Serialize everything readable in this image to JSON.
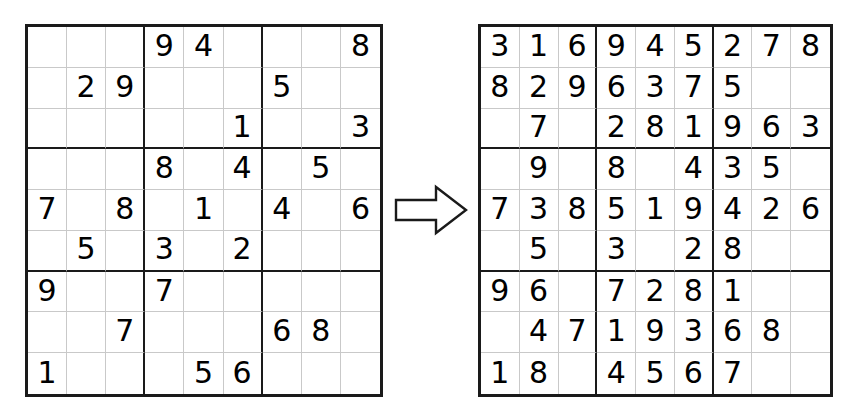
{
  "diagram": {
    "name": "sudoku-puzzle-to-solution",
    "arrow_label": "right-arrow",
    "ink_color": "#000000",
    "grid_line_color": "#c9c9c9",
    "block_line_color": "#1a1a1a",
    "background_color": "#ffffff"
  },
  "puzzle": {
    "title": "Sudoku puzzle (givens)",
    "rows": [
      [
        "",
        "",
        "",
        "9",
        "4",
        "",
        "",
        "",
        "8"
      ],
      [
        "",
        "2",
        "9",
        "",
        "",
        "",
        "5",
        "",
        ""
      ],
      [
        "",
        "",
        "",
        "",
        "",
        "1",
        "",
        "",
        "3"
      ],
      [
        "",
        "",
        "",
        "8",
        "",
        "4",
        "",
        "5",
        ""
      ],
      [
        "7",
        "",
        "8",
        "",
        "1",
        "",
        "4",
        "",
        "6"
      ],
      [
        "",
        "5",
        "",
        "3",
        "",
        "2",
        "",
        "",
        ""
      ],
      [
        "9",
        "",
        "",
        "7",
        "",
        "",
        "",
        "",
        ""
      ],
      [
        "",
        "",
        "7",
        "",
        "",
        "",
        "6",
        "8",
        ""
      ],
      [
        "1",
        "",
        "",
        "",
        "5",
        "6",
        "",
        "",
        ""
      ]
    ]
  },
  "solution": {
    "title": "Sudoku grid partially solved",
    "rows": [
      [
        "3",
        "1",
        "6",
        "9",
        "4",
        "5",
        "2",
        "7",
        "8"
      ],
      [
        "8",
        "2",
        "9",
        "6",
        "3",
        "7",
        "5",
        "",
        ""
      ],
      [
        "",
        "7",
        "",
        "2",
        "8",
        "1",
        "9",
        "6",
        "3"
      ],
      [
        "",
        "9",
        "",
        "8",
        "",
        "4",
        "3",
        "5",
        ""
      ],
      [
        "7",
        "3",
        "8",
        "5",
        "1",
        "9",
        "4",
        "2",
        "6"
      ],
      [
        "",
        "5",
        "",
        "3",
        "",
        "2",
        "8",
        "",
        ""
      ],
      [
        "9",
        "6",
        "",
        "7",
        "2",
        "8",
        "1",
        "",
        ""
      ],
      [
        "",
        "4",
        "7",
        "1",
        "9",
        "3",
        "6",
        "8",
        ""
      ],
      [
        "1",
        "8",
        "",
        "4",
        "5",
        "6",
        "7",
        "",
        ""
      ]
    ]
  }
}
